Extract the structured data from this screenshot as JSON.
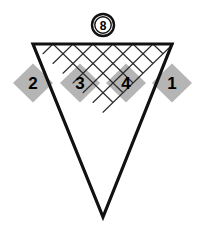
{
  "figure": {
    "title_badge": {
      "label": "8",
      "shape": "double-ring-circle",
      "center_x": 103,
      "center_y": 25,
      "outer_radius": 11,
      "inner_radius": 8.5
    },
    "colors": {
      "shaded_fill": "#b5b5b5",
      "unshaded_fill": "#ffffff",
      "outline_stroke": "#111111",
      "interior_stroke": "#2a2a2a",
      "background": "#ffffff",
      "label_color": "#000000"
    },
    "geometry": {
      "top_left_x": 33,
      "top_right_x": 172,
      "top_y": 44,
      "apex_x": 103,
      "apex_y": 217,
      "left_vertex_x": 13,
      "left_vertex_y": 83,
      "right_vertex_x": 192,
      "right_vertex_y": 83,
      "rhombus_half_width": 20,
      "rhombus_half_height": 19.5,
      "rows": 4,
      "outline_stroke_width": 3.2,
      "interior_stroke_width": 1.1
    },
    "rows": [
      {
        "row_index": 0,
        "cells": [
          {
            "label": "2",
            "shaded": true,
            "center_x": 33,
            "center_y": 83
          },
          {
            "label": "3",
            "shaded": true,
            "center_x": 80,
            "center_y": 83
          },
          {
            "label": "4",
            "shaded": true,
            "center_x": 126,
            "center_y": 83
          },
          {
            "label": "1",
            "shaded": true,
            "center_x": 172,
            "center_y": 83
          }
        ],
        "unshaded_between": [
          {
            "label": "",
            "shaded": false,
            "center_x": 56,
            "center_y": 83
          },
          {
            "label": "",
            "shaded": false,
            "center_x": 103,
            "center_y": 83
          },
          {
            "label": "",
            "shaded": false,
            "center_x": 149,
            "center_y": 83
          }
        ]
      },
      {
        "row_index": 1,
        "cells": [
          {
            "label": "",
            "shaded": false,
            "center_x": 56,
            "center_y": 122
          },
          {
            "label": "",
            "shaded": false,
            "center_x": 103,
            "center_y": 122
          },
          {
            "label": "",
            "shaded": false,
            "center_x": 149,
            "center_y": 122
          }
        ]
      },
      {
        "row_index": 2,
        "cells": [
          {
            "label": "",
            "shaded": false,
            "center_x": 80,
            "center_y": 161
          },
          {
            "label": "",
            "shaded": false,
            "center_x": 126,
            "center_y": 161
          }
        ]
      },
      {
        "row_index": 3,
        "cells": [
          {
            "label": "",
            "shaded": false,
            "center_x": 103,
            "center_y": 200
          }
        ]
      }
    ],
    "shaded_labels": [
      "2",
      "3",
      "4",
      "1"
    ]
  }
}
